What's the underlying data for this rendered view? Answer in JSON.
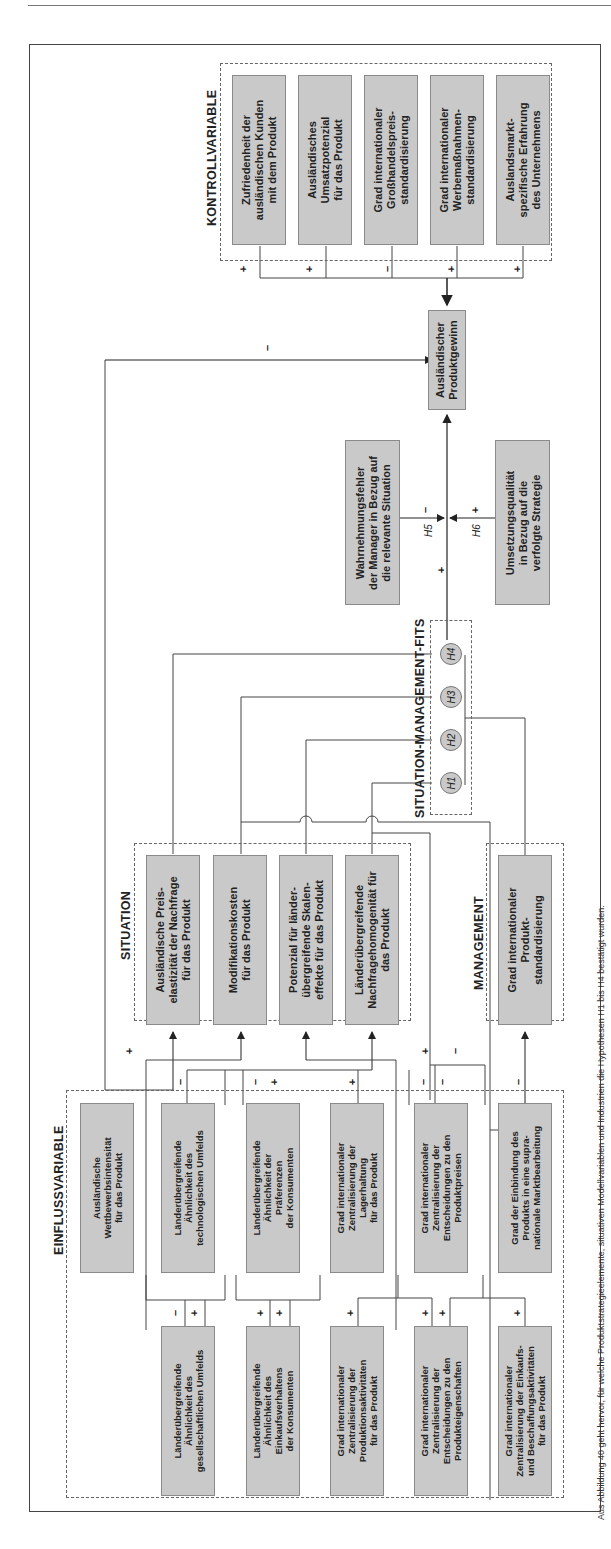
{
  "diagram": {
    "groups": {
      "kontroll": "KONTROLLVARIABLE",
      "situation": "SITUATION",
      "management": "MANAGEMENT",
      "fits": "SITUATION-MANAGEMENT-FITS",
      "einfluss": "EINFLUSSVARIABLE"
    },
    "kontroll_boxes": [
      "Zufriedenheit der\nausländischen Kunden\nmit dem Produkt",
      "Ausländisches\nUmsatzpotenzial\nfür das Produkt",
      "Grad internationaler\nGroßhandelspreis-\nstandardisierung",
      "Grad internationaler\nWerbemaßnahmen-\nstandardisierung",
      "Auslandsmarkt-\nspezifische Erfahrung\ndes Unternehmens"
    ],
    "kontroll_signs": [
      "+",
      "+",
      "–",
      "+",
      "+"
    ],
    "outcome": "Ausländischer\nProduktgewinn",
    "moderators": {
      "perception": "Wahrnehmungsfehler\nder Manager in Bezug auf\ndie relevante Situation",
      "implementation": "Umsetzungsqualität\nin Bezug auf die\nverfolgte Strategie",
      "h5": "H5",
      "h6": "H6",
      "h5_sign": "–",
      "h6_sign": "+",
      "fit_sign": "+"
    },
    "competition_to_profit_sign": "–",
    "hypotheses": [
      "H1",
      "H2",
      "H3",
      "H4"
    ],
    "situation_boxes": [
      "Ausländische Preis-\nelastizität der Nachfrage\nfür das Produkt",
      "Modifikationskosten\nfür das Produkt",
      "Potenzial für länder-\nübergreifende Skalen-\neffekte für das Produkt",
      "Länderübergreifende\nNachfragehomogenität für\ndas Produkt"
    ],
    "management_box": "Grad internationaler\nProdukt-\nstandardisierung",
    "einfluss_row1": [
      "Ausländische\nWettbewerbsintensität\nfür das Produkt",
      "Länderübergreifende\nÄhnlichkeit des\ntechnologischen Umfelds",
      "Länderübergreifende\nÄhnlichkeit der\nPräferenzen\nder Konsumenten",
      "Grad internationaler\nZentralisierung der\nLagerhaltung\nfür das Produkt",
      "Grad internationaler\nZentralisierung der\nEntscheidungen zu den\nProduktpreisen",
      "Grad der Einbindung des\nProdukts in eine supra-\nnationale Marktbearbeitung"
    ],
    "einfluss_row2": [
      "Länderübergreifende\nÄhnlichkeit des\ngesellschaftlichen Umfelds",
      "Länderübergreifende\nÄhnlichkeit des\nEinkaufsverhaltens\nder Konsumenten",
      "Grad internationaler\nZentralisierung der\nProduktionsaktivitäten\nfür das Produkt",
      "Grad internationaler\nZentralisierung der\nEntscheidungen zu den\nProdukteigenschaften",
      "Grad internationaler\nZentralisierung der Einkaufs-\nund Beschaffungsaktivitäten\nfür das Produkt"
    ],
    "row1_signs": [
      "+",
      "–",
      "–",
      "+",
      "+",
      "–",
      "–",
      "+",
      "–",
      "–"
    ],
    "row2_signs": [
      "–",
      "+",
      "+",
      "+",
      "+",
      "+",
      "+",
      "+"
    ],
    "caption": "Aus Abbildung 40 geht hervor, für welche Produktstrategieelemente, situativen Modellvariablen und Industrien die Hypothesen H1 bis H4 bestätigt wurden."
  }
}
